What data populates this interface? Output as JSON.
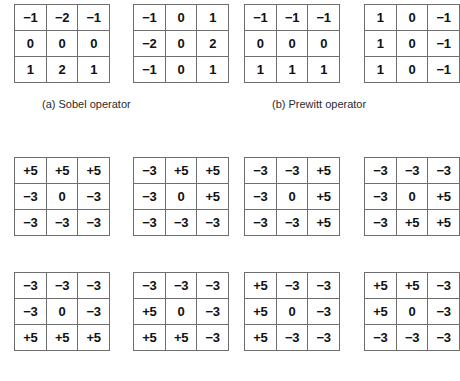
{
  "figure": {
    "background_color": "#ffffff",
    "border_color": "#6e6e6e",
    "text_color": "#111111"
  },
  "captions": {
    "sobel": "(a) Sobel operator",
    "prewitt": "(b) Prewitt operator"
  },
  "matrices": [
    {
      "id": "sobel-horizontal",
      "group": "sobel",
      "row": 1,
      "col": 1,
      "values": [
        "−1",
        "−2",
        "−1",
        "0",
        "0",
        "0",
        "1",
        "2",
        "1"
      ]
    },
    {
      "id": "sobel-vertical",
      "group": "sobel",
      "row": 1,
      "col": 2,
      "values": [
        "−1",
        "0",
        "1",
        "−2",
        "0",
        "2",
        "−1",
        "0",
        "1"
      ]
    },
    {
      "id": "prewitt-horizontal",
      "group": "prewitt",
      "row": 1,
      "col": 3,
      "values": [
        "−1",
        "−1",
        "−1",
        "0",
        "0",
        "0",
        "1",
        "1",
        "1"
      ]
    },
    {
      "id": "prewitt-vertical",
      "group": "prewitt",
      "row": 1,
      "col": 4,
      "values": [
        "1",
        "0",
        "−1",
        "1",
        "0",
        "−1",
        "1",
        "0",
        "−1"
      ]
    },
    {
      "id": "kirsch-north",
      "group": "kirsch",
      "row": 2,
      "col": 1,
      "values": [
        "+5",
        "+5",
        "+5",
        "−3",
        "0",
        "−3",
        "−3",
        "−3",
        "−3"
      ]
    },
    {
      "id": "kirsch-northeast",
      "group": "kirsch",
      "row": 2,
      "col": 2,
      "values": [
        "−3",
        "+5",
        "+5",
        "−3",
        "0",
        "+5",
        "−3",
        "−3",
        "−3"
      ]
    },
    {
      "id": "kirsch-east",
      "group": "kirsch",
      "row": 2,
      "col": 3,
      "values": [
        "−3",
        "−3",
        "+5",
        "−3",
        "0",
        "+5",
        "−3",
        "−3",
        "+5"
      ]
    },
    {
      "id": "kirsch-southeast",
      "group": "kirsch",
      "row": 2,
      "col": 4,
      "values": [
        "−3",
        "−3",
        "−3",
        "−3",
        "0",
        "+5",
        "−3",
        "+5",
        "+5"
      ]
    },
    {
      "id": "kirsch-south",
      "group": "kirsch",
      "row": 3,
      "col": 1,
      "values": [
        "−3",
        "−3",
        "−3",
        "−3",
        "0",
        "−3",
        "+5",
        "+5",
        "+5"
      ]
    },
    {
      "id": "kirsch-southwest",
      "group": "kirsch",
      "row": 3,
      "col": 2,
      "values": [
        "−3",
        "−3",
        "−3",
        "+5",
        "0",
        "−3",
        "+5",
        "+5",
        "−3"
      ]
    },
    {
      "id": "kirsch-west",
      "group": "kirsch",
      "row": 3,
      "col": 3,
      "values": [
        "+5",
        "−3",
        "−3",
        "+5",
        "0",
        "−3",
        "+5",
        "−3",
        "−3"
      ]
    },
    {
      "id": "kirsch-northwest",
      "group": "kirsch",
      "row": 3,
      "col": 4,
      "values": [
        "+5",
        "+5",
        "−3",
        "+5",
        "0",
        "−3",
        "−3",
        "−3",
        "−3"
      ]
    }
  ]
}
